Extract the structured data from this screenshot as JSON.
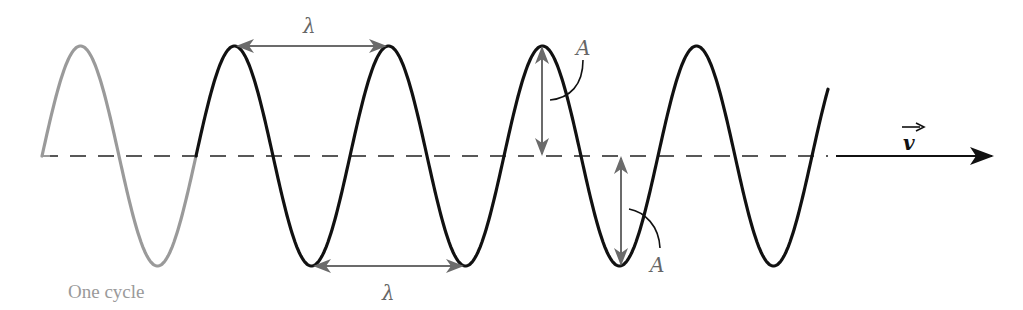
{
  "diagram": {
    "labels": {
      "wavelength_top": "λ",
      "wavelength_bottom": "λ",
      "amplitude_top": "A",
      "amplitude_bottom": "A",
      "one_cycle": "One cycle",
      "velocity": "v"
    },
    "colors": {
      "wave": "#111111",
      "first_cycle": "#9a9a9a",
      "annotation_arrows": "#6b6b6b",
      "axis": "#222222",
      "label_text": "#666666"
    },
    "wave": {
      "x_start": 42,
      "x_end": 828,
      "axis_y": 156,
      "amplitude_px": 110,
      "wavelength_px": 154,
      "cycles_shown": 5.1
    }
  }
}
